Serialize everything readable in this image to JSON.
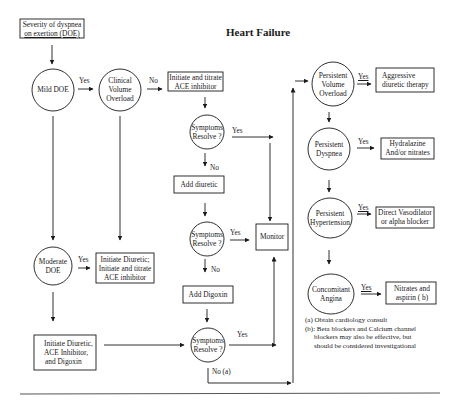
{
  "title": "Heart Failure",
  "nodes": {
    "start": {
      "type": "box",
      "text": [
        "Severity of dyspnea",
        "on exertion (DOE)"
      ]
    },
    "mild_doe": {
      "type": "circle",
      "text": [
        "Mild DOE"
      ]
    },
    "clinical_volume": {
      "type": "circle",
      "text": [
        "Clinical",
        "Volume",
        "Overload"
      ]
    },
    "ace_titrate": {
      "type": "box",
      "text": [
        "Initiate and titrate",
        "ACE inhibitor"
      ]
    },
    "symptoms_1": {
      "type": "circle",
      "text": [
        "Symptoms",
        "Resolve ?"
      ]
    },
    "add_diuretic": {
      "type": "box",
      "text": [
        "Add diuretic"
      ]
    },
    "symptoms_2": {
      "type": "circle",
      "text": [
        "Symptoms",
        "Resolve ?"
      ]
    },
    "add_digoxin": {
      "type": "box",
      "text": [
        "Add Digoxin"
      ]
    },
    "symptoms_3": {
      "type": "circle",
      "text": [
        "Symptoms",
        "Resolve ?"
      ]
    },
    "monitor": {
      "type": "box",
      "text": [
        "Monitor"
      ]
    },
    "moderate_doe": {
      "type": "circle",
      "text": [
        "Moderate",
        "DOE"
      ]
    },
    "diuretic_ace": {
      "type": "box",
      "text": [
        "Initiate Diuretic;",
        "Initiate and titrate",
        "ACE  inhibitor"
      ]
    },
    "diuretic_ace_digoxin": {
      "type": "box",
      "text": [
        "Initiate Diuretic,",
        "ACE Inhibitor,",
        "and Digoxin"
      ]
    },
    "persistent_volume": {
      "type": "circle",
      "text": [
        "Persistent",
        "Volume",
        "Overload"
      ]
    },
    "aggressive_diuretic": {
      "type": "box",
      "text": [
        "Aggressive",
        "diuretic    therapy"
      ]
    },
    "persistent_dyspnea": {
      "type": "circle",
      "text": [
        "Persistent",
        "Dyspnea"
      ]
    },
    "hydralazine": {
      "type": "box",
      "text": [
        "Hydralazine",
        "And/or  nitrates"
      ]
    },
    "persistent_hypertension": {
      "type": "circle",
      "text": [
        "Persistent",
        "Hypertension"
      ]
    },
    "vasodilator": {
      "type": "box",
      "text": [
        "Direct Vasodilator",
        "or alpha blocker"
      ]
    },
    "concomitant_angina": {
      "type": "circle",
      "text": [
        "Concomitant",
        "Angina"
      ]
    },
    "nitrates_aspirin": {
      "type": "box",
      "text": [
        "Nitrates and",
        "aspirin  ( b)"
      ]
    }
  },
  "edge_labels": {
    "mild_yes": "Yes",
    "clinical_no": "No",
    "sym1_yes": "Yes",
    "sym1_no": "No",
    "sym2_yes": "Yes",
    "sym2_no": "No",
    "sym3_yes": "Yes",
    "sym3_no": "No (a)",
    "moderate_yes": "Yes",
    "pvo_yes": "Yes",
    "pd_yes": "Yes",
    "ph_yes": "Yes",
    "ca_yes": "Yes"
  },
  "footnotes": [
    "(a) Obtain cardiology consult",
    "(b): Beta blockers and Calcium channel",
    "blockers may also be effective, but",
    "should be considered investigational"
  ],
  "colors": {
    "ink": "#1a1a1a",
    "background": "#ffffff",
    "rule": "#555555"
  }
}
